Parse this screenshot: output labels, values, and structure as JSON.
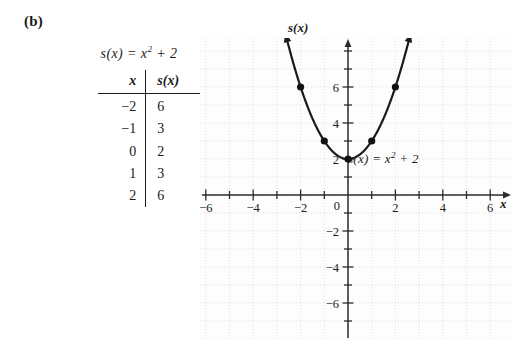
{
  "panel": {
    "label": "(b)"
  },
  "left_block": {
    "formula": "s(x) = x",
    "formula_exponent": "2",
    "formula_tail": " + 2",
    "table": {
      "headers": [
        "x",
        "s(x)"
      ],
      "rows": [
        {
          "x": "−2",
          "y": "6"
        },
        {
          "x": "−1",
          "y": "3"
        },
        {
          "x": "0",
          "y": "2"
        },
        {
          "x": "1",
          "y": "3"
        },
        {
          "x": "2",
          "y": "6"
        }
      ]
    }
  },
  "graph": {
    "y_axis_label": "s(x)",
    "x_axis_label": "x",
    "curve_label_head": "s(x) = x",
    "curve_label_exponent": "2",
    "curve_label_tail": " + 2",
    "origin_label": "0",
    "x_tick_labels": [
      "−6",
      "−4",
      "−2",
      "2",
      "4",
      "6"
    ],
    "y_tick_labels": [
      "6",
      "4",
      "−2",
      "−4",
      "−6"
    ],
    "colors": {
      "axis": "#2b2b2b",
      "curve": "#1a1a1a",
      "grid": "#d9d9d9",
      "plot_background": "#fdfdfd",
      "point": "#111111"
    }
  },
  "chart_data": {
    "type": "line",
    "title": "",
    "subtitle": "",
    "xlabel": "x",
    "ylabel": "s(x)",
    "annotations": [
      "s(x) = x² + 2"
    ],
    "function": "s(x) = x^2 + 2",
    "grid": true,
    "legend": "none",
    "xlim": [
      -7.5,
      7.5
    ],
    "ylim": [
      -7.5,
      8.5
    ],
    "x_ticks": [
      -6,
      -4,
      -2,
      0,
      2,
      4,
      6
    ],
    "y_ticks": [
      -6,
      -4,
      -2,
      0,
      2,
      4,
      6
    ],
    "x_minor_tick_step": 1,
    "y_minor_tick_step": 1,
    "marked_points": {
      "x": [
        -2,
        -1,
        0,
        1,
        2
      ],
      "y": [
        6,
        3,
        2,
        3,
        6
      ]
    },
    "series": [
      {
        "name": "s(x) = x² + 2",
        "x": [
          -2.5,
          -2.25,
          -2,
          -1.75,
          -1.5,
          -1.25,
          -1,
          -0.75,
          -0.5,
          -0.25,
          0,
          0.25,
          0.5,
          0.75,
          1,
          1.25,
          1.5,
          1.75,
          2,
          2.25,
          2.5
        ],
        "y": [
          8.25,
          7.0625,
          6,
          5.0625,
          4.25,
          3.5625,
          3,
          2.5625,
          2.25,
          2.0625,
          2,
          2.0625,
          2.25,
          2.5625,
          3,
          3.5625,
          4.25,
          5.0625,
          6,
          7.0625,
          8.25
        ]
      }
    ]
  }
}
